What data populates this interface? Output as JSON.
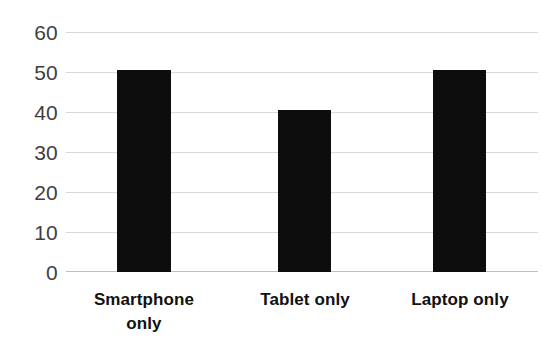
{
  "chart_data": {
    "type": "bar",
    "title": "",
    "subtitle": "",
    "xlabel": "",
    "ylabel": "",
    "categories": [
      "Smartphone only",
      "Tablet only",
      "Laptop only"
    ],
    "values": [
      50.5,
      40.5,
      50.5
    ],
    "series": [
      {
        "name": "",
        "values": [
          50.5,
          40.5,
          50.5
        ]
      }
    ],
    "ylim": [
      0,
      60
    ],
    "yticks": [
      0,
      10,
      20,
      30,
      40,
      50,
      60
    ],
    "ytick_labels": [
      "0",
      "10",
      "20",
      "30",
      "40",
      "50",
      "60"
    ],
    "grid": true,
    "grid_axis": "y",
    "legend": false,
    "legend_position": "none",
    "bar_color": "#0d0d0d",
    "gridline_color": "#d9d9d9",
    "axis_color": "#bfbfbf",
    "tick_label_color": "#3f3f3f",
    "category_label_color": "#111111",
    "background_color": "#ffffff",
    "annotations": []
  },
  "axis": {
    "y_labels": [
      {
        "text": "60",
        "value": 60
      },
      {
        "text": "50",
        "value": 50
      },
      {
        "text": "40",
        "value": 40
      },
      {
        "text": "30",
        "value": 30
      },
      {
        "text": "20",
        "value": 20
      },
      {
        "text": "10",
        "value": 10
      },
      {
        "text": "0",
        "value": 0
      }
    ]
  },
  "categories": [
    {
      "line1": "Smartphone",
      "line2": "only",
      "full": "Smartphone only"
    },
    {
      "line1": "Tablet only",
      "line2": "",
      "full": "Tablet only"
    },
    {
      "line1": "Laptop only",
      "line2": "",
      "full": "Laptop only"
    }
  ]
}
